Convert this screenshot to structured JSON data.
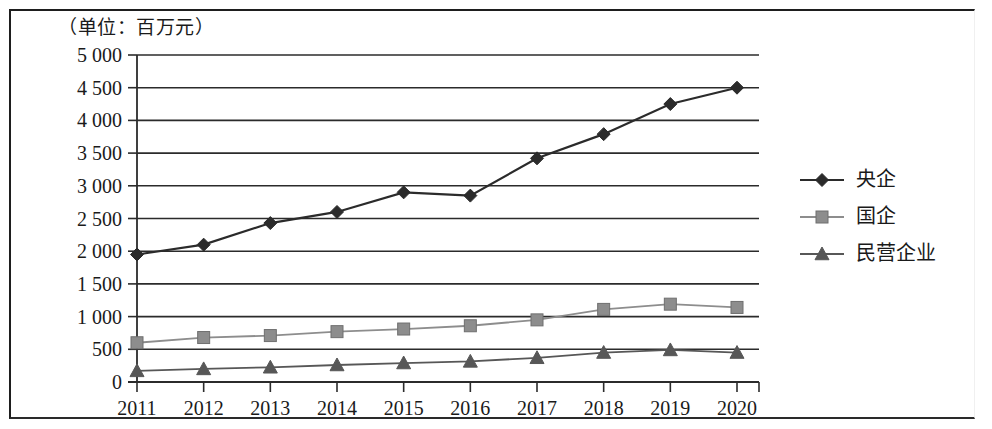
{
  "figure": {
    "unit_label": "（单位：百万元）"
  },
  "chart_data": {
    "type": "line",
    "title": "",
    "subtitle": "",
    "xlabel": "",
    "ylabel": "（单位：百万元）",
    "categories": [
      "2011",
      "2012",
      "2013",
      "2014",
      "2015",
      "2016",
      "2017",
      "2018",
      "2019",
      "2020"
    ],
    "x": [
      2011,
      2012,
      2013,
      2014,
      2015,
      2016,
      2017,
      2018,
      2019,
      2020
    ],
    "ylim": [
      0,
      5000
    ],
    "ytick_values": [
      0,
      500,
      1000,
      1500,
      2000,
      2500,
      3000,
      3500,
      4000,
      4500,
      5000
    ],
    "ytick_labels": [
      "0",
      "500",
      "1 000",
      "1 500",
      "2 000",
      "2 500",
      "3 000",
      "3 500",
      "4 000",
      "4 500",
      "5 000"
    ],
    "grid": true,
    "grid_axis": "y",
    "legend_position": "right",
    "series": [
      {
        "name": "央企",
        "marker": "diamond",
        "color": "#2b2b2b",
        "values": [
          1950,
          2100,
          2430,
          2600,
          2900,
          2850,
          3420,
          3790,
          4250,
          4500
        ]
      },
      {
        "name": "国企",
        "marker": "square",
        "color": "#8d8d8d",
        "values": [
          600,
          680,
          710,
          770,
          810,
          860,
          950,
          1110,
          1190,
          1140
        ]
      },
      {
        "name": "民营企业",
        "marker": "triangle",
        "color": "#575757",
        "values": [
          170,
          200,
          225,
          260,
          290,
          315,
          370,
          450,
          490,
          450
        ]
      }
    ]
  }
}
